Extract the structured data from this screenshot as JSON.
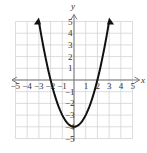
{
  "chart_data": {
    "type": "line",
    "title": "",
    "function": "y = x^2 - 4",
    "xlabel": "x",
    "ylabel": "y",
    "xlim": [
      -5,
      5
    ],
    "ylim": [
      -5,
      5
    ],
    "grid": true,
    "x_ticks": [
      "-5",
      "-4",
      "-3",
      "-2",
      "-1",
      "1",
      "2",
      "3",
      "4",
      "5"
    ],
    "y_ticks": [
      "5",
      "4",
      "3",
      "2",
      "1",
      "-1",
      "-2",
      "-3",
      "-4",
      "-5"
    ],
    "series": [
      {
        "name": "parabola",
        "x": [
          -3,
          -2.5,
          -2,
          -1.5,
          -1,
          -0.5,
          0,
          0.5,
          1,
          1.5,
          2,
          2.5,
          3
        ],
        "y": [
          5,
          2.25,
          0,
          -1.75,
          -3,
          -3.75,
          -4,
          -3.75,
          -3,
          -1.75,
          0,
          2.25,
          5
        ]
      }
    ],
    "key_points": {
      "vertex": [
        0,
        -4
      ],
      "x_intercepts": [
        [
          -2,
          0
        ],
        [
          2,
          0
        ]
      ]
    },
    "colors": {
      "curve": "#111111",
      "grid": "#cfcfcf",
      "axes": "#777777"
    }
  },
  "labels": {
    "x_axis": "x",
    "y_axis": "y"
  }
}
